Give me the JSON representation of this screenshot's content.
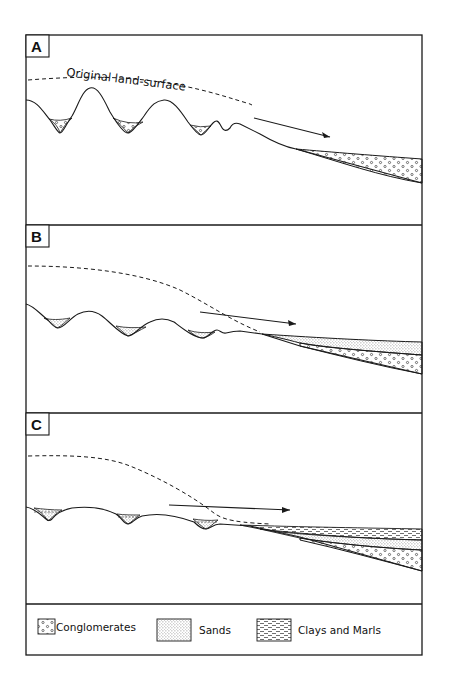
{
  "figure": {
    "panels": [
      {
        "label": "A",
        "annotation": "Original land-surface"
      },
      {
        "label": "B"
      },
      {
        "label": "C"
      }
    ],
    "legend": {
      "items": [
        {
          "key": "conglomerates",
          "label": "Conglomerates"
        },
        {
          "key": "sands",
          "label": "Sands"
        },
        {
          "key": "clays",
          "label": "Clays and Marls"
        }
      ]
    },
    "colors": {
      "ink": "#1a1a1a",
      "paper": "#ffffff"
    }
  }
}
